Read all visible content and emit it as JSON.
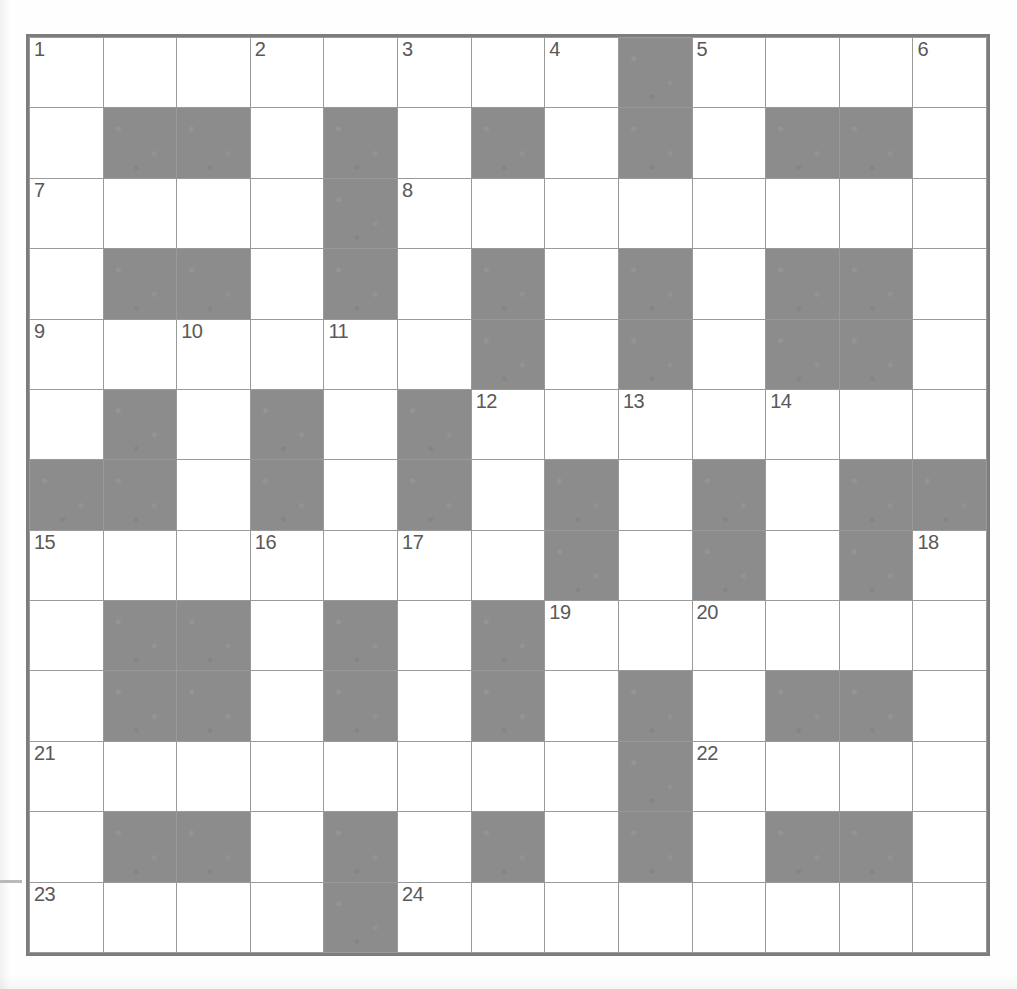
{
  "puzzle": {
    "title": "Crossword Grid",
    "rows": 13,
    "cols": 13,
    "colors": {
      "block_fill": "#8c8c8c",
      "cell_fill": "#ffffff",
      "grid_line": "#9a9a9a",
      "border": "#7d7d7d",
      "number_text": "#595959",
      "page_background": "#fefefe"
    },
    "legend": {
      "white": "open letter cell",
      "block": "blocked cell"
    },
    "grid": [
      [
        "white",
        "white",
        "white",
        "white",
        "white",
        "white",
        "white",
        "white",
        "block",
        "white",
        "white",
        "white",
        "white"
      ],
      [
        "white",
        "block",
        "block",
        "white",
        "block",
        "white",
        "block",
        "white",
        "block",
        "white",
        "block",
        "block",
        "white"
      ],
      [
        "white",
        "white",
        "white",
        "white",
        "block",
        "white",
        "white",
        "white",
        "white",
        "white",
        "white",
        "white",
        "white"
      ],
      [
        "white",
        "block",
        "block",
        "white",
        "block",
        "white",
        "block",
        "white",
        "block",
        "white",
        "block",
        "block",
        "white"
      ],
      [
        "white",
        "white",
        "white",
        "white",
        "white",
        "white",
        "block",
        "white",
        "block",
        "white",
        "block",
        "block",
        "white"
      ],
      [
        "white",
        "block",
        "white",
        "block",
        "white",
        "block",
        "white",
        "white",
        "white",
        "white",
        "white",
        "white",
        "white"
      ],
      [
        "block",
        "block",
        "white",
        "block",
        "white",
        "block",
        "white",
        "block",
        "white",
        "block",
        "white",
        "block",
        "block"
      ],
      [
        "white",
        "white",
        "white",
        "white",
        "white",
        "white",
        "white",
        "block",
        "white",
        "block",
        "white",
        "block",
        "white"
      ],
      [
        "white",
        "block",
        "block",
        "white",
        "block",
        "white",
        "block",
        "white",
        "white",
        "white",
        "white",
        "white",
        "white"
      ],
      [
        "white",
        "block",
        "block",
        "white",
        "block",
        "white",
        "block",
        "white",
        "block",
        "white",
        "block",
        "block",
        "white"
      ],
      [
        "white",
        "white",
        "white",
        "white",
        "white",
        "white",
        "white",
        "white",
        "block",
        "white",
        "white",
        "white",
        "white"
      ],
      [
        "white",
        "block",
        "block",
        "white",
        "block",
        "white",
        "block",
        "white",
        "block",
        "white",
        "block",
        "block",
        "white"
      ],
      [
        "white",
        "white",
        "white",
        "white",
        "block",
        "white",
        "white",
        "white",
        "white",
        "white",
        "white",
        "white",
        "white"
      ]
    ],
    "numbers": [
      {
        "n": "1",
        "row": 0,
        "col": 0
      },
      {
        "n": "2",
        "row": 0,
        "col": 3
      },
      {
        "n": "3",
        "row": 0,
        "col": 5
      },
      {
        "n": "4",
        "row": 0,
        "col": 7
      },
      {
        "n": "5",
        "row": 0,
        "col": 9
      },
      {
        "n": "6",
        "row": 0,
        "col": 12
      },
      {
        "n": "7",
        "row": 2,
        "col": 0
      },
      {
        "n": "8",
        "row": 2,
        "col": 5
      },
      {
        "n": "9",
        "row": 4,
        "col": 0
      },
      {
        "n": "10",
        "row": 4,
        "col": 2
      },
      {
        "n": "11",
        "row": 4,
        "col": 4
      },
      {
        "n": "12",
        "row": 5,
        "col": 6
      },
      {
        "n": "13",
        "row": 5,
        "col": 8
      },
      {
        "n": "14",
        "row": 5,
        "col": 10
      },
      {
        "n": "15",
        "row": 7,
        "col": 0
      },
      {
        "n": "16",
        "row": 7,
        "col": 3
      },
      {
        "n": "17",
        "row": 7,
        "col": 5
      },
      {
        "n": "18",
        "row": 7,
        "col": 12
      },
      {
        "n": "19",
        "row": 8,
        "col": 7
      },
      {
        "n": "20",
        "row": 8,
        "col": 9
      },
      {
        "n": "21",
        "row": 10,
        "col": 0
      },
      {
        "n": "22",
        "row": 10,
        "col": 9
      },
      {
        "n": "23",
        "row": 12,
        "col": 0
      },
      {
        "n": "24",
        "row": 12,
        "col": 5
      }
    ]
  }
}
